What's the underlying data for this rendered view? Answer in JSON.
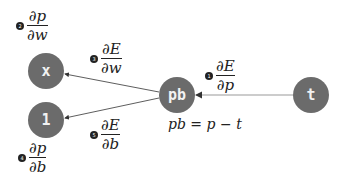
{
  "nodes": {
    "x": {
      "label": "x"
    },
    "one": {
      "label": "1"
    },
    "pb": {
      "label": "pb"
    },
    "t": {
      "label": "t"
    }
  },
  "colors": {
    "node_fill": "#6b6b6b",
    "node_text": "#f2f2f2",
    "edge": "#333333"
  },
  "gradients": [
    {
      "step": "1",
      "num": "∂E",
      "den": "∂p"
    },
    {
      "step": "2",
      "num": "∂p",
      "den": "∂w"
    },
    {
      "step": "3",
      "num": "∂E",
      "den": "∂w"
    },
    {
      "step": "4",
      "num": "∂p",
      "den": "∂b"
    },
    {
      "step": "5",
      "num": "∂E",
      "den": "∂b"
    }
  ],
  "equation": "pb = p − t"
}
